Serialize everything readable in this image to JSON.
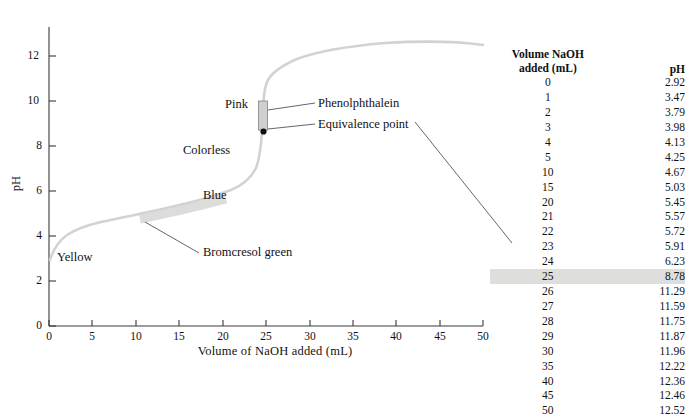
{
  "chart_data": {
    "type": "line",
    "title": "",
    "xlabel": "Volume of NaOH added  (mL)",
    "ylabel": "pH",
    "xlim": [
      0,
      50
    ],
    "ylim": [
      0,
      13
    ],
    "xticks": [
      0,
      5,
      10,
      15,
      20,
      25,
      30,
      35,
      40,
      45,
      50
    ],
    "yticks": [
      0,
      2,
      4,
      6,
      8,
      10,
      12
    ],
    "grid": false,
    "legend": "none",
    "x": [
      0,
      1,
      2,
      3,
      4,
      5,
      10,
      15,
      20,
      21,
      22,
      23,
      24,
      25,
      26,
      27,
      28,
      29,
      30,
      35,
      40,
      45,
      50
    ],
    "y": [
      2.92,
      3.47,
      3.79,
      3.98,
      4.13,
      4.25,
      4.67,
      5.03,
      5.45,
      5.57,
      5.72,
      5.91,
      6.23,
      8.78,
      11.29,
      11.59,
      11.75,
      11.87,
      11.96,
      12.22,
      12.36,
      12.46,
      12.52
    ],
    "series": [
      {
        "name": "Titration curve of weak acid with NaOH",
        "values": [
          2.92,
          3.47,
          3.79,
          3.98,
          4.13,
          4.25,
          4.67,
          5.03,
          5.45,
          5.57,
          5.72,
          5.91,
          6.23,
          8.78,
          11.29,
          11.59,
          11.75,
          11.87,
          11.96,
          12.22,
          12.36,
          12.46,
          12.52
        ]
      }
    ],
    "annotations": [
      {
        "name": "equivalence-point",
        "label": "Equivalence point",
        "x": 25,
        "y": 8.78
      },
      {
        "name": "phenolphthalein-range",
        "label": "Phenolphthalein",
        "x": 25,
        "y_low": 8.2,
        "y_high": 10.0
      },
      {
        "name": "bromcresol-green-range",
        "label": "Bromcresol green",
        "x_low": 11,
        "x_high": 21,
        "y_low": 4.75,
        "y_high": 5.6
      },
      {
        "name": "phenolphthalein-pink",
        "label": "Pink"
      },
      {
        "name": "phenolphthalein-colorless",
        "label": "Colorless"
      },
      {
        "name": "bromcresol-green-blue",
        "label": "Blue"
      },
      {
        "name": "bromcresol-green-yellow",
        "label": "Yellow"
      }
    ]
  },
  "labels": {
    "pink": "Pink",
    "colorless": "Colorless",
    "blue": "Blue",
    "yellow": "Yellow",
    "phenolphthalein": "Phenolphthalein",
    "equivalence_point": "Equivalence point",
    "bromcresol_green": "Bromcresol green",
    "axis_x": "Volume of NaOH added  (mL)",
    "axis_y": "pH"
  },
  "table": {
    "header_volume_line1": "Volume NaOH",
    "header_volume_line2": "added (mL)",
    "header_ph": "pH",
    "highlight_row_index": 13,
    "rows": [
      {
        "volume": "0",
        "ph": "2.92"
      },
      {
        "volume": "1",
        "ph": "3.47"
      },
      {
        "volume": "2",
        "ph": "3.79"
      },
      {
        "volume": "3",
        "ph": "3.98"
      },
      {
        "volume": "4",
        "ph": "4.13"
      },
      {
        "volume": "5",
        "ph": "4.25"
      },
      {
        "volume": "10",
        "ph": "4.67"
      },
      {
        "volume": "15",
        "ph": "5.03"
      },
      {
        "volume": "20",
        "ph": "5.45"
      },
      {
        "volume": "21",
        "ph": "5.57"
      },
      {
        "volume": "22",
        "ph": "5.72"
      },
      {
        "volume": "23",
        "ph": "5.91"
      },
      {
        "volume": "24",
        "ph": "6.23"
      },
      {
        "volume": "25",
        "ph": "8.78"
      },
      {
        "volume": "26",
        "ph": "11.29"
      },
      {
        "volume": "27",
        "ph": "11.59"
      },
      {
        "volume": "28",
        "ph": "11.75"
      },
      {
        "volume": "29",
        "ph": "11.87"
      },
      {
        "volume": "30",
        "ph": "11.96"
      },
      {
        "volume": "35",
        "ph": "12.22"
      },
      {
        "volume": "40",
        "ph": "12.36"
      },
      {
        "volume": "45",
        "ph": "12.46"
      },
      {
        "volume": "50",
        "ph": "12.52"
      }
    ]
  },
  "colors": {
    "curve": "#cfcfcf",
    "indicator_band": "#d9d9d9",
    "highlight": "#dededd",
    "axis": "#3a3a3a",
    "text": "#111111"
  }
}
